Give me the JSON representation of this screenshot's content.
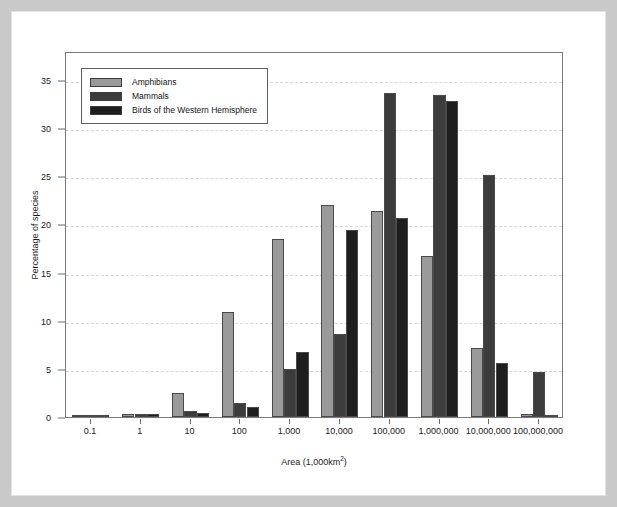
{
  "figure": {
    "legend_position": "top-left"
  },
  "chart_data": {
    "type": "bar",
    "title": "",
    "xlabel": "Area (1,000km2)",
    "xlabel_base": "Area (1,000km",
    "xlabel_sup": "2",
    "xlabel_tail": ")",
    "ylabel": "Percentage of species",
    "categories": [
      "0.1",
      "1",
      "10",
      "100",
      "1,000",
      "10,000",
      "100,000",
      "1,000,000",
      "10,000,000",
      "100,000,000"
    ],
    "ylim": [
      0,
      38
    ],
    "yticks": [
      0,
      5,
      10,
      15,
      20,
      25,
      30,
      35
    ],
    "ytick_labels": [
      "0",
      "5",
      "10",
      "15",
      "20",
      "25",
      "30",
      "35"
    ],
    "grid": true,
    "series": [
      {
        "name": "Amphibians",
        "color": "#9a9a9a",
        "values": [
          0.1,
          0.3,
          2.5,
          10.9,
          18.5,
          22.0,
          21.4,
          16.7,
          7.2,
          0.3
        ]
      },
      {
        "name": "Mammals",
        "color": "#3c3c3c",
        "values": [
          0.2,
          0.3,
          0.6,
          1.5,
          5.0,
          8.6,
          33.6,
          33.4,
          25.1,
          4.7
        ]
      },
      {
        "name": "Birds of the Western Hemisphere",
        "color": "#1e1e1e",
        "values": [
          0.1,
          0.3,
          0.4,
          1.0,
          6.8,
          19.4,
          20.7,
          32.8,
          5.6,
          0.1
        ]
      }
    ]
  }
}
